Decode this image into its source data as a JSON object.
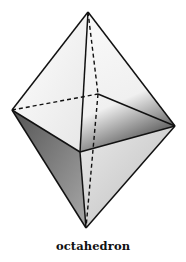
{
  "diagram": {
    "title": "octahedron",
    "vertices": {
      "top": [
        88,
        12
      ],
      "left": [
        12,
        110
      ],
      "right": [
        175,
        126
      ],
      "front": [
        80,
        152
      ],
      "back": [
        98,
        94
      ],
      "bottom": [
        86,
        228
      ]
    },
    "colors": {
      "edge": "#111111",
      "upper_left_face": "#f4f4f4",
      "upper_right_face": "#ececec",
      "lower_left_face": "#8a8a8a",
      "lower_right_face": "#d6d6d6"
    }
  }
}
